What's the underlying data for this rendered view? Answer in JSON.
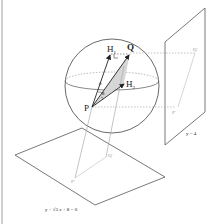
{
  "diagram": {
    "points": {
      "P": "P",
      "Q": "Q",
      "H1": "H",
      "H1_sub": "1",
      "H2": "H",
      "H2_sub": "2",
      "Q_proj_right": "Q'",
      "P_proj_right": "P'",
      "Q_proj_bottom": "Q'",
      "P_proj_bottom": "P'"
    },
    "angles": {
      "theta_upper": "θ",
      "theta_lower": "θ"
    },
    "planes": {
      "right_plane_label": "y = 4",
      "bottom_plane_label": "y + √3 z + 8 = 0"
    },
    "colors": {
      "line": "#333333",
      "faint_line": "#aaaaaa",
      "shade": "#d6d6d6"
    }
  }
}
